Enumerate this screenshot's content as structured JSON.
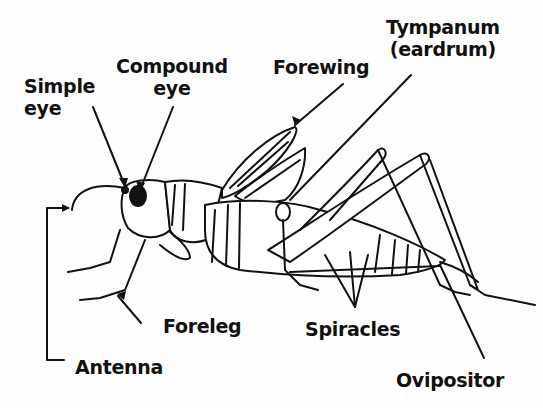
{
  "diagram": {
    "colors": {
      "ink": "#111111",
      "background": "#fdfdfd"
    },
    "labels": [
      {
        "id": "simple-eye",
        "lines": [
          "Simple",
          "eye"
        ]
      },
      {
        "id": "compound-eye",
        "lines": [
          "Compound",
          "eye"
        ]
      },
      {
        "id": "forewing",
        "lines": [
          "Forewing"
        ]
      },
      {
        "id": "tympanum",
        "lines": [
          "Tympanum",
          "(eardrum)"
        ]
      },
      {
        "id": "foreleg",
        "lines": [
          "Foreleg"
        ]
      },
      {
        "id": "antenna",
        "lines": [
          "Antenna"
        ]
      },
      {
        "id": "spiracles",
        "lines": [
          "Spiracles"
        ]
      },
      {
        "id": "ovipositor",
        "lines": [
          "Ovipositor"
        ]
      }
    ]
  }
}
